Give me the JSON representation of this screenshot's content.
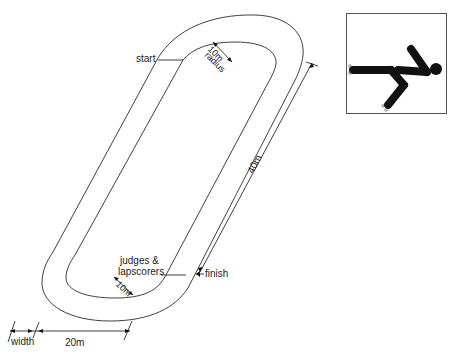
{
  "diagram": {
    "labels": {
      "start": "start",
      "finish": "finish",
      "radius_top": "10m",
      "radius_top_sub": "radius",
      "radius_bottom": "10m",
      "judges": "judges &",
      "lapscorers": "lapscorers",
      "straight_length": "40m",
      "width": "width",
      "diameter": "20m"
    },
    "icon": "skater-pictogram-icon",
    "colors": {
      "line": "#2a2a2a",
      "fill": "#111111",
      "background": "#ffffff"
    }
  }
}
